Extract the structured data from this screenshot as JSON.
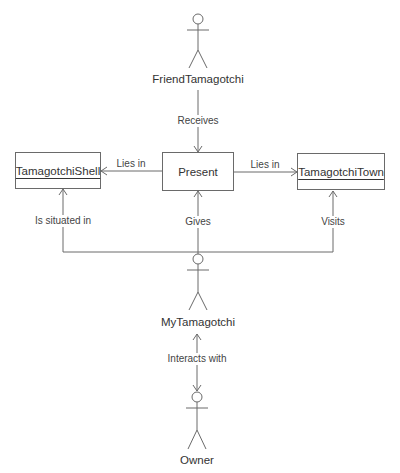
{
  "diagram": {
    "type": "UML collaboration / object diagram",
    "actors": [
      {
        "id": "friend",
        "label": "FriendTamagotchi"
      },
      {
        "id": "my",
        "label": "MyTamagotchi"
      },
      {
        "id": "owner",
        "label": "Owner"
      }
    ],
    "objects": [
      {
        "id": "shell",
        "label": "TamagotchiShell",
        "underlined": true
      },
      {
        "id": "present",
        "label": "Present",
        "underlined": false
      },
      {
        "id": "town",
        "label": "TamagotchiTown",
        "underlined": true
      }
    ],
    "relations": [
      {
        "from": "friend",
        "to": "present",
        "label": "Receives"
      },
      {
        "from": "present",
        "to": "shell",
        "label": "Lies in"
      },
      {
        "from": "present",
        "to": "town",
        "label": "Lies in"
      },
      {
        "from": "my",
        "to": "shell",
        "label": "Is situated in"
      },
      {
        "from": "my",
        "to": "present",
        "label": "Gives"
      },
      {
        "from": "my",
        "to": "town",
        "label": "Visits"
      },
      {
        "from": "owner",
        "to": "my",
        "label": "Interacts with",
        "bidirectional": true
      }
    ],
    "line_color": "#6a6a6a"
  }
}
